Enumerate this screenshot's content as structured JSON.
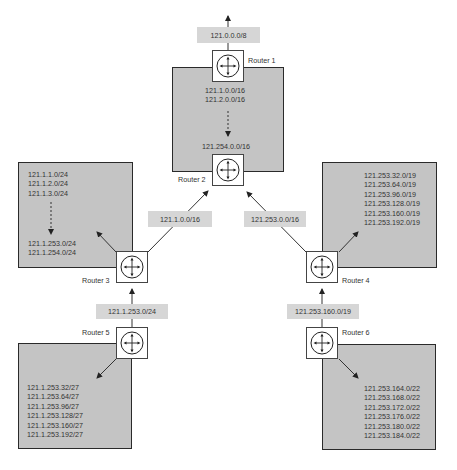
{
  "diagram": {
    "type": "hierarchical-routing-aggregation",
    "routers": [
      {
        "id": "r1",
        "name": "Router 1"
      },
      {
        "id": "r2",
        "name": "Router 2"
      },
      {
        "id": "r3",
        "name": "Router 3"
      },
      {
        "id": "r4",
        "name": "Router 4"
      },
      {
        "id": "r5",
        "name": "Router 5"
      },
      {
        "id": "r6",
        "name": "Router 6"
      }
    ],
    "advertisements": {
      "r1_up": "121.0.0.0/8",
      "r3_to_r2": "121.1.0.0/16",
      "r4_to_r2": "121.253.0.0/16",
      "r5_to_r3": "121.1.253.0/24",
      "r6_to_r4": "121.253.160.0/19"
    },
    "networks": {
      "top": {
        "first": [
          "121.1.0.0/16",
          "121.2.0.0/16"
        ],
        "last": [
          "121.254.0.0/16"
        ]
      },
      "left": {
        "first": [
          "121.1.1.0/24",
          "121.1.2.0/24",
          "121.1.3.0/24"
        ],
        "last": [
          "121.1.253.0/24",
          "121.1.254.0/24"
        ]
      },
      "right": {
        "items": [
          "121.253.32.0/19",
          "121.253.64.0/19",
          "121.253.96.0/19",
          "121.253.128.0/19",
          "121.253.160.0/19",
          "121.253.192.0/19"
        ]
      },
      "bottom_left": {
        "items": [
          "121.1.253.32/27",
          "121.1.253.64/27",
          "121.1.253.96/27",
          "121.1.253.128/27",
          "121.1.253.160/27",
          "121.1.253.192/27"
        ]
      },
      "bottom_right": {
        "items": [
          "121.253.164.0/22",
          "121.253.168.0/22",
          "121.253.172.0/22",
          "121.253.176.0/22",
          "121.253.180.0/22",
          "121.253.184.0/22"
        ]
      }
    },
    "colors": {
      "network_fill": "#c4c4c4",
      "label_fill": "#d6d6d6",
      "border": "#2a2a2a"
    }
  }
}
